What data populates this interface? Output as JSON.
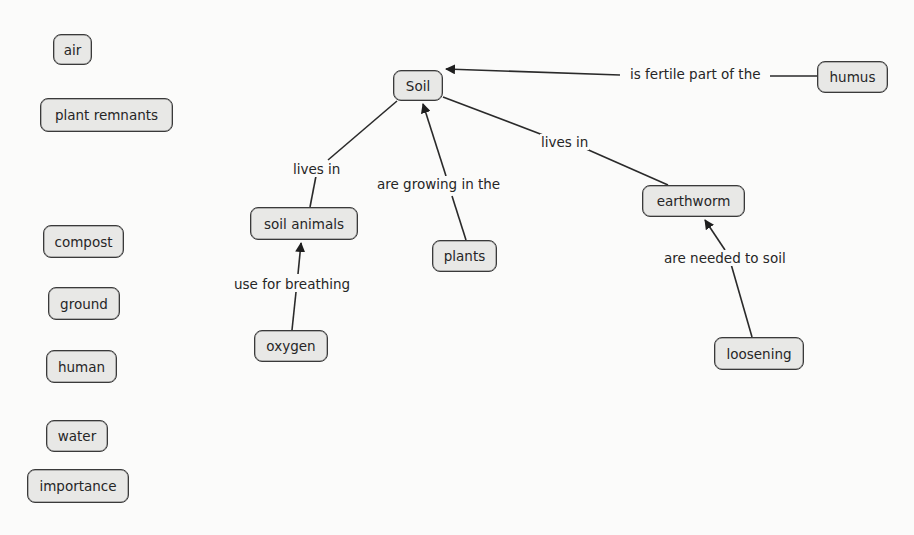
{
  "concept_map": {
    "colors": {
      "background": "#fbfbfa",
      "node_fill": "#e8e8e6",
      "node_border": "#3a3a3a",
      "line": "#2a2a2a",
      "text": "#262626"
    },
    "nodes": {
      "soil": "Soil",
      "humus": "humus",
      "soil_animals": "soil animals",
      "plants": "plants",
      "earthworm": "earthworm",
      "oxygen": "oxygen",
      "loosening": "loosening",
      "air": "air",
      "plant_remnants": "plant remnants",
      "compost": "compost",
      "ground": "ground",
      "human": "human",
      "water": "water",
      "importance": "importance"
    },
    "links": {
      "humus_soil": "is fertile part of the",
      "soil_animals_soil": "lives in",
      "plants_soil": "are growing in the",
      "earthworm_soil": "lives in",
      "oxygen_soil_animals": "use for breathing",
      "loosening_earthworm": "are needed to soil"
    }
  }
}
